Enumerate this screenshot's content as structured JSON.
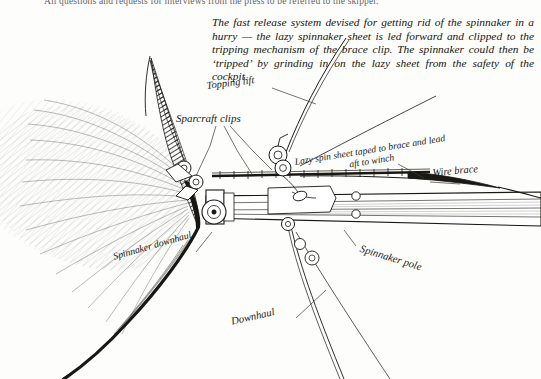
{
  "page": {
    "width": 541,
    "height": 379,
    "background_color": "#fdfdfc",
    "ink_color": "#1a1813"
  },
  "running_header": {
    "text": "All questions and requests for interviews from the press to be referred to the skipper."
  },
  "caption": {
    "text": "The fast release system devised for getting rid of the spinnaker in a hurry — the lazy spinnaker sheet is led forward and clipped to the tripping mechanism of the brace clip. The spinnaker could then be ‘tripped’ by grinding in on the lazy sheet from the safety of the cockpit."
  },
  "figure": {
    "type": "technical-line-drawing",
    "labels": [
      {
        "id": "topping-lift",
        "text": "Topping lift"
      },
      {
        "id": "sparcraft-clips",
        "text": "Sparcraft clips"
      },
      {
        "id": "lazy-spin-sheet-1",
        "text": "Lazy spin sheet taped to brace and lead"
      },
      {
        "id": "lazy-spin-sheet-2",
        "text": "aft to winch"
      },
      {
        "id": "wire-brace",
        "text": "Wire brace"
      },
      {
        "id": "spinnaker-pole",
        "text": "Spinnaker pole"
      },
      {
        "id": "spinnaker-downhaul",
        "text": "Spinnaker downhaul"
      },
      {
        "id": "downhaul",
        "text": "Downhaul"
      }
    ]
  }
}
